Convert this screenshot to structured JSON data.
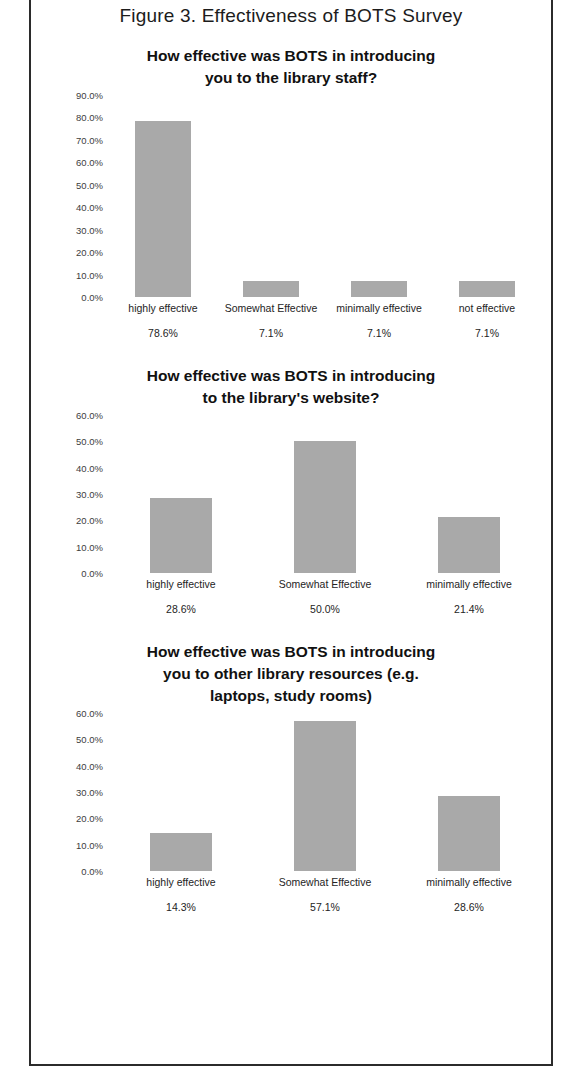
{
  "figure": {
    "caption": "Figure 3. Effectiveness of BOTS Survey"
  },
  "edge_sliver": {
    "fragments": [
      "e",
      "s",
      "t",
      "o",
      "r",
      "e",
      "i",
      "n",
      "a",
      "l",
      "s",
      "o",
      "r",
      "e",
      "d",
      "i",
      "t",
      "s",
      "e",
      "n"
    ]
  },
  "chart_data": [
    {
      "type": "bar",
      "title": "How effective was BOTS in introducing you to the library staff?",
      "title_lines": [
        "How effective was BOTS in introducing",
        "you to the library staff?"
      ],
      "categories": [
        "highly effective",
        "Somewhat Effective",
        "minimally effective",
        "not effective"
      ],
      "values": [
        78.6,
        7.1,
        7.1,
        7.1
      ],
      "value_labels": [
        "78.6%",
        "7.1%",
        "7.1%",
        "7.1%"
      ],
      "ticks": [
        "90.0%",
        "80.0%",
        "70.0%",
        "60.0%",
        "50.0%",
        "40.0%",
        "30.0%",
        "20.0%",
        "10.0%",
        "0.0%"
      ],
      "ylim": [
        0,
        90
      ],
      "xlabel": "",
      "ylabel": "",
      "grid": false,
      "legend": false,
      "bar_color": "#a9a9a9",
      "bar_width_px": 56
    },
    {
      "type": "bar",
      "title": "How effective was BOTS in introducing to the library's website?",
      "title_lines": [
        "How effective was BOTS in introducing",
        "to the library's website?"
      ],
      "categories": [
        "highly effective",
        "Somewhat Effective",
        "minimally effective"
      ],
      "values": [
        28.6,
        50.0,
        21.4
      ],
      "value_labels": [
        "28.6%",
        "50.0%",
        "21.4%"
      ],
      "ticks": [
        "60.0%",
        "50.0%",
        "40.0%",
        "30.0%",
        "20.0%",
        "10.0%",
        "0.0%"
      ],
      "ylim": [
        0,
        60
      ],
      "xlabel": "",
      "ylabel": "",
      "grid": false,
      "legend": false,
      "bar_color": "#a9a9a9",
      "bar_width_px": 62
    },
    {
      "type": "bar",
      "title": "How effective was BOTS in introducing you to other library resources (e.g. laptops, study rooms)",
      "title_lines": [
        "How effective was BOTS in introducing",
        "you to other library resources (e.g.",
        "laptops, study rooms)"
      ],
      "categories": [
        "highly effective",
        "Somewhat Effective",
        "minimally effective"
      ],
      "values": [
        14.3,
        57.1,
        28.6
      ],
      "value_labels": [
        "14.3%",
        "57.1%",
        "28.6%"
      ],
      "ticks": [
        "60.0%",
        "50.0%",
        "40.0%",
        "30.0%",
        "20.0%",
        "10.0%",
        "0.0%"
      ],
      "ylim": [
        0,
        60
      ],
      "xlabel": "",
      "ylabel": "",
      "grid": false,
      "legend": false,
      "bar_color": "#a9a9a9",
      "bar_width_px": 62
    }
  ]
}
